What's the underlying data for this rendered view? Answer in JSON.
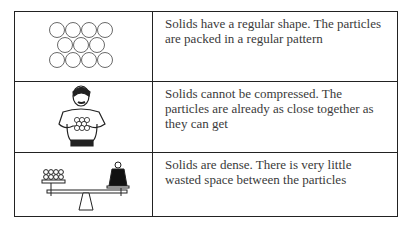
{
  "table": {
    "rows": [
      {
        "illustration": "regular-particle-lattice",
        "text": "Solids have a regular shape. The particles are packed in a regular pattern"
      },
      {
        "illustration": "strongman-squeezing-particles",
        "text": "Solids cannot be compressed. The particles are already as close together as they can get"
      },
      {
        "illustration": "balance-particles-vs-weight",
        "text": "Solids are dense. There is very little wasted space between the particles"
      }
    ]
  },
  "colors": {
    "border": "#222222",
    "text": "#3a3a3a",
    "background": "#ffffff"
  }
}
